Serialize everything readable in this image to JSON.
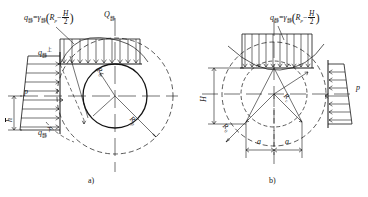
{
  "figure": {
    "panels": [
      {
        "id": "a",
        "caption": "a)",
        "labels": {
          "top_formula": {
            "q_symbol": "q",
            "q_subscript": "静",
            "equals": "=",
            "gamma_symbol": "γ",
            "gamma_subscript": "静",
            "open_paren": "(",
            "R_symbol": "R",
            "R_subscript": "p",
            "minus": "−",
            "frac_num": "H",
            "frac_den": "2",
            "close_paren": ")"
          },
          "shear_force": {
            "symbol": "Q",
            "subscript": "静"
          },
          "q_upper": {
            "symbol": "q",
            "subscript": "静",
            "superscript": "上"
          },
          "q_lower": {
            "symbol": "q",
            "subscript": "静",
            "superscript": "下"
          },
          "pressure": "p",
          "depth": "h",
          "radius_inner": {
            "symbol": "R",
            "subscript": "0"
          },
          "radius_outer": {
            "symbol": "R",
            "subscript": "p"
          }
        }
      },
      {
        "id": "b",
        "caption": "b)",
        "labels": {
          "top_formula": {
            "q_symbol": "q",
            "q_subscript": "静",
            "equals": "=",
            "gamma_symbol": "γ",
            "gamma_subscript": "静",
            "open_paren": "(",
            "R_symbol": "R",
            "R_subscript": "p",
            "minus": "−",
            "frac_num": "H",
            "frac_den": "2",
            "close_paren": ")"
          },
          "height": "H",
          "pressure": "p",
          "radius_inner": {
            "symbol": "R",
            "subscript": "c"
          },
          "radius_outer": {
            "symbol": "R",
            "subscript": "0"
          },
          "dim_left": "a",
          "dim_right": "a"
        }
      }
    ],
    "colors": {
      "line": "#141414",
      "text": "#141414",
      "background": "#ffffff"
    }
  }
}
